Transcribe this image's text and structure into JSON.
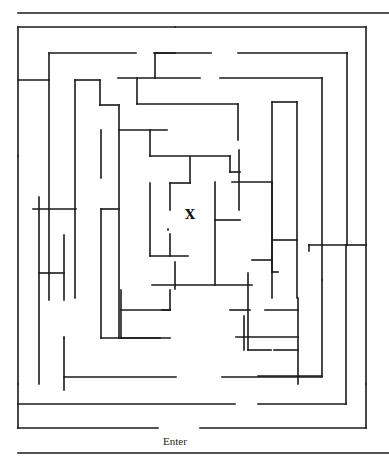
{
  "puzzle": {
    "type": "maze",
    "goal_label": "X",
    "entrance_label": "Enter",
    "line_color": "#1a1a1a",
    "background": "#ffffff"
  },
  "walls": [
    [
      18,
      13,
      389,
      13
    ],
    [
      18,
      27,
      175,
      27
    ],
    [
      175,
      27,
      366,
      27
    ],
    [
      366,
      27,
      366,
      384
    ],
    [
      18,
      27,
      18,
      156
    ],
    [
      18,
      156,
      18,
      384
    ],
    [
      18,
      80,
      49,
      80
    ],
    [
      49,
      53,
      136,
      53
    ],
    [
      49,
      53,
      49,
      300
    ],
    [
      154,
      53,
      211,
      53
    ],
    [
      238,
      53,
      347,
      53
    ],
    [
      347,
      53,
      347,
      245
    ],
    [
      347,
      245,
      366,
      245
    ],
    [
      175,
      53,
      155,
      53
    ],
    [
      155,
      53,
      155,
      78
    ],
    [
      118,
      78,
      200,
      78
    ],
    [
      137,
      78,
      137,
      104
    ],
    [
      137,
      104,
      238,
      104
    ],
    [
      238,
      104,
      238,
      140
    ],
    [
      220,
      78,
      322,
      78
    ],
    [
      322,
      78,
      322,
      280
    ],
    [
      75,
      80,
      100,
      80
    ],
    [
      75,
      80,
      75,
      298
    ],
    [
      100,
      80,
      100,
      105
    ],
    [
      100,
      105,
      119,
      105
    ],
    [
      119,
      105,
      119,
      338
    ],
    [
      119,
      130,
      167,
      130
    ],
    [
      150,
      130,
      150,
      156
    ],
    [
      150,
      156,
      230,
      156
    ],
    [
      230,
      156,
      230,
      172
    ],
    [
      230,
      172,
      240,
      172
    ],
    [
      101,
      130,
      101,
      178
    ],
    [
      33,
      209,
      76,
      209
    ],
    [
      39,
      197,
      39,
      384
    ],
    [
      39,
      273,
      64,
      273
    ],
    [
      64,
      235,
      64,
      300
    ],
    [
      64,
      338,
      64,
      390
    ],
    [
      64,
      338,
      64,
      337
    ],
    [
      101,
      209,
      119,
      209
    ],
    [
      101,
      209,
      101,
      338
    ],
    [
      150,
      183,
      150,
      256
    ],
    [
      150,
      256,
      188,
      256
    ],
    [
      170,
      234,
      170,
      256
    ],
    [
      170,
      183,
      170,
      210
    ],
    [
      170,
      183,
      190,
      183
    ],
    [
      190,
      157,
      190,
      183
    ],
    [
      168,
      229,
      168,
      230
    ],
    [
      239,
      150,
      239,
      210
    ],
    [
      232,
      182,
      272,
      182
    ],
    [
      272,
      182,
      272,
      272
    ],
    [
      272,
      272,
      278,
      272
    ],
    [
      215,
      182,
      215,
      285
    ],
    [
      215,
      220,
      240,
      220
    ],
    [
      252,
      260,
      272,
      260
    ],
    [
      152,
      285,
      252,
      285
    ],
    [
      248,
      273,
      248,
      350
    ],
    [
      248,
      350,
      271,
      350
    ],
    [
      121,
      290,
      121,
      338
    ],
    [
      121,
      310,
      170,
      310
    ],
    [
      170,
      290,
      170,
      310
    ],
    [
      101,
      338,
      170,
      338
    ],
    [
      162,
      310,
      170,
      310
    ],
    [
      230,
      310,
      250,
      310
    ],
    [
      244,
      316,
      244,
      350
    ],
    [
      265,
      310,
      298,
      310
    ],
    [
      298,
      298,
      298,
      384
    ],
    [
      175,
      262,
      175,
      289
    ],
    [
      120,
      338,
      160,
      338
    ],
    [
      236,
      337,
      298,
      337
    ],
    [
      272,
      102,
      297,
      102
    ],
    [
      272,
      102,
      272,
      298
    ],
    [
      297,
      102,
      297,
      298
    ],
    [
      272,
      240,
      297,
      240
    ],
    [
      309,
      245,
      347,
      245
    ],
    [
      309,
      245,
      309,
      251
    ],
    [
      322,
      280,
      322,
      376
    ],
    [
      274,
      350,
      298,
      350
    ],
    [
      322,
      376,
      258,
      376
    ],
    [
      64,
      377,
      176,
      377
    ],
    [
      222,
      377,
      322,
      377
    ],
    [
      18,
      404,
      235,
      404
    ],
    [
      258,
      404,
      346,
      404
    ],
    [
      346,
      404,
      346,
      245
    ],
    [
      18,
      384,
      18,
      428
    ],
    [
      18,
      428,
      158,
      428
    ],
    [
      200,
      428,
      366,
      428
    ],
    [
      366,
      384,
      366,
      428
    ],
    [
      18,
      453,
      389,
      453
    ]
  ]
}
